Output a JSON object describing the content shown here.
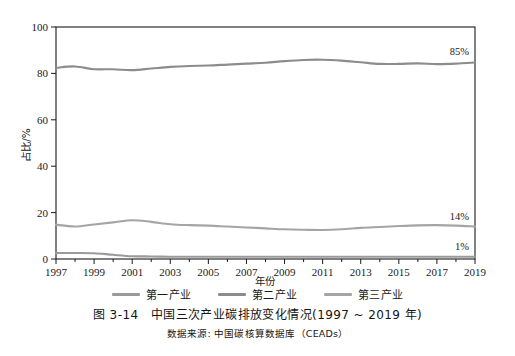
{
  "chart_data": {
    "type": "line",
    "xlabel": "年份",
    "ylabel": "占比/%",
    "xlim": [
      1997,
      2019
    ],
    "ylim": [
      0,
      100
    ],
    "grid": false,
    "legend_position": "below-axis",
    "x": [
      1997,
      1998,
      1999,
      2000,
      2001,
      2002,
      2003,
      2004,
      2005,
      2006,
      2007,
      2008,
      2009,
      2010,
      2011,
      2012,
      2013,
      2014,
      2015,
      2016,
      2017,
      2018,
      2019
    ],
    "xticks": [
      1997,
      1999,
      2001,
      2003,
      2005,
      2007,
      2009,
      2011,
      2013,
      2015,
      2017,
      2019
    ],
    "xtick_labels": [
      "1997",
      "1999",
      "2001",
      "2003",
      "2005",
      "2007",
      "2009",
      "2011",
      "2013",
      "2015",
      "2017",
      "2019"
    ],
    "yticks": [
      0,
      20,
      40,
      60,
      80,
      100
    ],
    "ytick_labels": [
      "0",
      "20",
      "40",
      "60",
      "80",
      "100"
    ],
    "series": [
      {
        "name": "第一产业",
        "color": "#9a9a9a",
        "end_label": "1%",
        "values": [
          2.6,
          2.6,
          2.5,
          1.8,
          1.2,
          1.1,
          1.0,
          1.0,
          1.0,
          1.0,
          1.0,
          1.0,
          1.0,
          1.0,
          1.0,
          1.0,
          1.0,
          1.0,
          1.0,
          1.0,
          1.0,
          1.0,
          1.0
        ]
      },
      {
        "name": "第二产业",
        "color": "#8c8c8c",
        "end_label": "85%",
        "values": [
          82.4,
          83.0,
          81.8,
          81.8,
          81.4,
          82.1,
          82.8,
          83.2,
          83.4,
          83.8,
          84.2,
          84.6,
          85.3,
          85.8,
          85.9,
          85.5,
          84.8,
          84.1,
          84.1,
          84.3,
          84.0,
          84.2,
          84.7
        ]
      },
      {
        "name": "第三产业",
        "color": "#a5a5a5",
        "end_label": "14%",
        "values": [
          14.8,
          14.0,
          14.9,
          15.8,
          16.7,
          16.0,
          15.0,
          14.6,
          14.4,
          14.0,
          13.6,
          13.2,
          12.8,
          12.6,
          12.5,
          12.8,
          13.4,
          13.8,
          14.2,
          14.5,
          14.6,
          14.4,
          14.0
        ]
      }
    ],
    "annotations": [
      {
        "text": "85%",
        "series": "第二产业"
      },
      {
        "text": "14%",
        "series": "第三产业"
      },
      {
        "text": "1%",
        "series": "第一产业"
      }
    ]
  },
  "caption": {
    "figure_number": "图 3-14",
    "title": "中国三次产业碳排放变化情况(1997 ~ 2019 年)",
    "main": "图 3-14　中国三次产业碳排放变化情况(1997 ~ 2019 年)",
    "source": "数据来源: 中国碳核算数据库（CEADs）"
  },
  "legend": {
    "items": [
      {
        "label": "第一产业",
        "color": "#9a9a9a"
      },
      {
        "label": "第二产业",
        "color": "#8c8c8c"
      },
      {
        "label": "第三产业",
        "color": "#a5a5a5"
      }
    ]
  },
  "colors": {
    "axis": "#1a1a1a",
    "background": "#ffffff",
    "series_primary": "#9a9a9a",
    "series_secondary": "#8c8c8c",
    "series_tertiary": "#a5a5a5"
  }
}
